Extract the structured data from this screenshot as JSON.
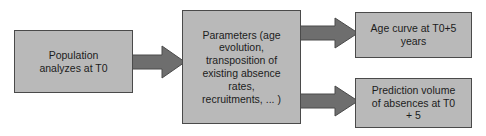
{
  "diagram": {
    "type": "flowchart",
    "orientation": "left-to-right",
    "colors": {
      "node_fill": "#b9b9b9",
      "node_border": "#4a4a4a",
      "arrow_fill": "#6e6e6e",
      "arrow_border": "#4a4a4a",
      "text": "#1c1c1c",
      "background": "#ffffff"
    },
    "nodes": [
      {
        "id": "population",
        "label": "Population\nanalyzes at T0"
      },
      {
        "id": "parameters",
        "label": "Parameters (age\nevolution,\ntransposition of\nexisting absence\nrates,\nrecruitments, ... )"
      },
      {
        "id": "age_curve",
        "label": "Age curve at T0+5\nyears"
      },
      {
        "id": "prediction",
        "label": "Prediction volume\nof absences at T0\n+ 5"
      }
    ],
    "arrows": [
      {
        "id": "population-to-parameters",
        "from": "population",
        "to": "parameters",
        "direction": "right"
      },
      {
        "id": "parameters-to-age-curve",
        "from": "parameters",
        "to": "age_curve",
        "direction": "right"
      },
      {
        "id": "parameters-to-prediction",
        "from": "parameters",
        "to": "prediction",
        "direction": "right"
      }
    ]
  }
}
